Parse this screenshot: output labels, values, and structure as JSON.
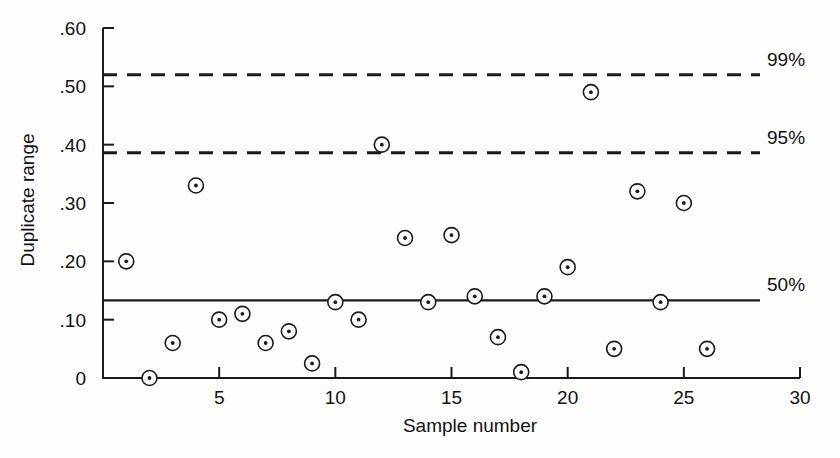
{
  "chart_data": {
    "type": "scatter",
    "title": "",
    "xlabel": "Sample number",
    "ylabel": "Duplicate range",
    "xlim": [
      0,
      30
    ],
    "ylim": [
      0,
      0.6
    ],
    "grid": false,
    "legend": "none",
    "x_ticks": [
      5,
      10,
      15,
      20,
      25,
      30
    ],
    "x_tick_labels": [
      "5",
      "10",
      "15",
      "20",
      "25",
      "30"
    ],
    "y_ticks": [
      0,
      0.1,
      0.2,
      0.3,
      0.4,
      0.5,
      0.6
    ],
    "y_tick_labels": [
      "0",
      ".10",
      ".20",
      ".30",
      ".40",
      ".50",
      ".60"
    ],
    "x": [
      1,
      2,
      3,
      4,
      5,
      6,
      7,
      8,
      9,
      10,
      11,
      12,
      13,
      14,
      15,
      16,
      17,
      18,
      19,
      20,
      21,
      22,
      23,
      24,
      25,
      26
    ],
    "y": [
      0.2,
      0.0,
      0.06,
      0.33,
      0.1,
      0.11,
      0.06,
      0.08,
      0.025,
      0.13,
      0.1,
      0.4,
      0.24,
      0.13,
      0.245,
      0.14,
      0.07,
      0.01,
      0.14,
      0.19,
      0.49,
      0.05,
      0.32,
      0.13,
      0.3,
      0.05
    ],
    "marker": "circle-with-center-dot",
    "reference_lines": [
      {
        "name": "99% limit",
        "label": "99%",
        "value": 0.52,
        "style": "dashed"
      },
      {
        "name": "95% limit",
        "label": "95%",
        "value": 0.386,
        "style": "dashed"
      },
      {
        "name": "50% limit",
        "label": "50%",
        "value": 0.133,
        "style": "solid"
      }
    ]
  }
}
